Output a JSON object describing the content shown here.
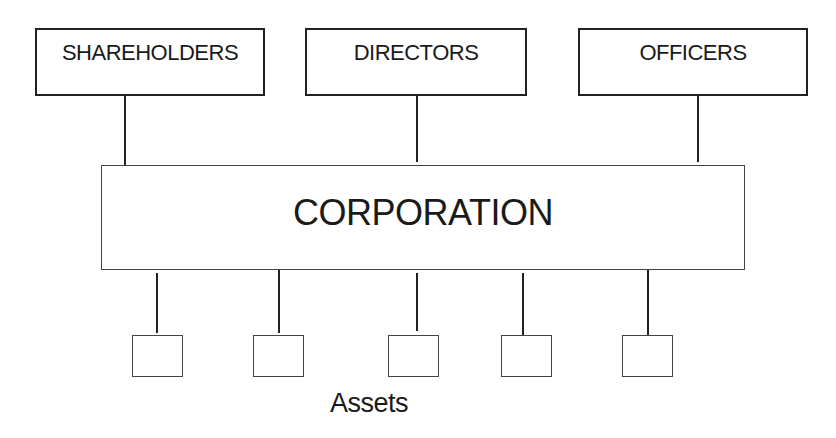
{
  "diagram": {
    "top_entities": [
      {
        "label": "SHAREHOLDERS"
      },
      {
        "label": "DIRECTORS"
      },
      {
        "label": "OFFICERS"
      }
    ],
    "central_entity": {
      "label": "CORPORATION"
    },
    "assets": {
      "count": 5,
      "label": "Assets"
    }
  }
}
